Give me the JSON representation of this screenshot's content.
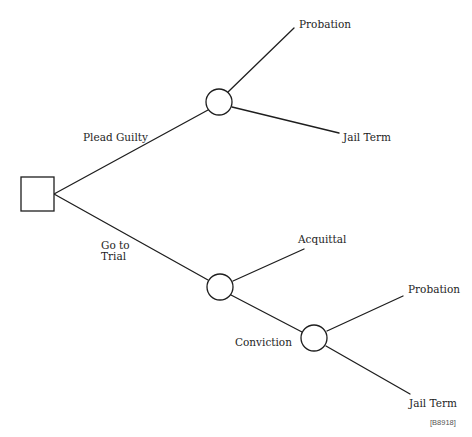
{
  "diagram": {
    "type": "decision-tree",
    "figure_code": "[B8918]",
    "colors": {
      "stroke": "#1e1e1e",
      "background": "#ffffff",
      "text": "#1e1e1e"
    },
    "root": {
      "kind": "decision",
      "shape": "square",
      "branches": [
        {
          "label": "Plead Guilty",
          "node": {
            "kind": "chance",
            "shape": "circle",
            "outcomes": [
              {
                "label": "Probation"
              },
              {
                "label": "Jail Term"
              }
            ]
          }
        },
        {
          "label": "Go to\nTrial",
          "node": {
            "kind": "chance",
            "shape": "circle",
            "outcomes": [
              {
                "label": "Acquittal"
              },
              {
                "label": "Conviction",
                "node": {
                  "kind": "chance",
                  "shape": "circle",
                  "outcomes": [
                    {
                      "label": "Probation"
                    },
                    {
                      "label": "Jail Term"
                    }
                  ]
                }
              }
            ]
          }
        }
      ]
    }
  }
}
